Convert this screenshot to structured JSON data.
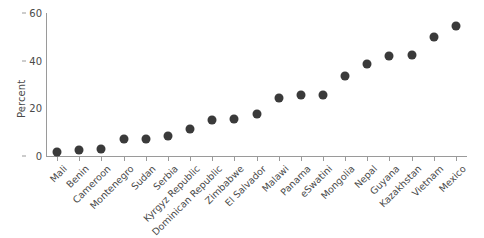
{
  "chart_data": {
    "type": "scatter",
    "title": "",
    "xlabel": "",
    "ylabel": "Percent",
    "ylim": [
      0,
      60
    ],
    "yticks": [
      0,
      20,
      40,
      60
    ],
    "grid": false,
    "legend": null,
    "marker_color": "#3a3a3a",
    "axis_color": "#9a9a9a",
    "categories": [
      "Mali",
      "Benin",
      "Cameroon",
      "Montenegro",
      "Sudan",
      "Serbia",
      "Kyrgyz Republic",
      "Dominican Republic",
      "Zimbabwe",
      "El Salvador",
      "Malawi",
      "Panama",
      "eSwatini",
      "Mongolia",
      "Nepal",
      "Guyana",
      "Kazakhstan",
      "Vietnam",
      "Mexico"
    ],
    "values": [
      1.8,
      2.7,
      2.8,
      7.0,
      7.0,
      8.6,
      11.5,
      15.0,
      15.6,
      17.8,
      24.2,
      25.5,
      25.8,
      33.5,
      38.6,
      41.8,
      42.2,
      50.0,
      54.5
    ]
  }
}
